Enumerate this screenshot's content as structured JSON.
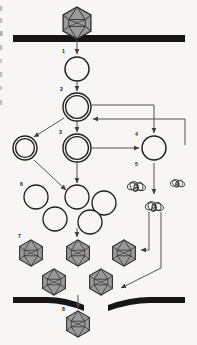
{
  "figure": {
    "background_color": "#f7f6f4",
    "line_color": "#4a4a4a",
    "membrane_color": "#161616",
    "capsid_fill": "#9a9a9a",
    "capsid_stroke": "#2b2b2b",
    "vesicle_stroke": "#1f1f1f",
    "label_color": "#1a1a1a"
  },
  "steps": [
    {
      "id": "1",
      "label": "1",
      "x": 62,
      "y": 53,
      "name": "step-1-entry"
    },
    {
      "id": "2",
      "label": "2",
      "x": 60,
      "y": 91,
      "name": "step-2-uncoating"
    },
    {
      "id": "3",
      "label": "3",
      "x": 59,
      "y": 134,
      "name": "step-3-replication"
    },
    {
      "id": "4",
      "label": "4",
      "x": 135,
      "y": 136,
      "name": "step-4-transcription"
    },
    {
      "id": "5",
      "label": "5",
      "x": 135,
      "y": 166,
      "name": "step-5-translation"
    },
    {
      "id": "6",
      "label": "6",
      "x": 20,
      "y": 186,
      "name": "step-6-assembly-pool"
    },
    {
      "id": "7",
      "label": "7",
      "x": 18,
      "y": 238,
      "name": "step-7-maturation"
    },
    {
      "id": "8",
      "label": "8",
      "x": 62,
      "y": 311,
      "name": "step-8-release"
    }
  ],
  "membranes": [
    {
      "name": "top-membrane",
      "x": 13,
      "y": 35,
      "width": 172,
      "height": 7
    },
    {
      "name": "bottom-membrane-left",
      "x": 13,
      "y": 297,
      "width": 72,
      "height": 7
    },
    {
      "name": "bottom-membrane-right",
      "x": 105,
      "y": 297,
      "width": 80,
      "height": 7
    }
  ],
  "virions": [
    {
      "name": "virion-extracellular-top",
      "cx": 77,
      "cy": 23,
      "r": 17
    },
    {
      "name": "virion-assembled-1",
      "cx": 31,
      "cy": 253,
      "r": 13
    },
    {
      "name": "virion-assembled-2",
      "cx": 78,
      "cy": 253,
      "r": 13
    },
    {
      "name": "virion-assembled-3",
      "cx": 124,
      "cy": 253,
      "r": 13
    },
    {
      "name": "virion-assembled-4",
      "cx": 54,
      "cy": 282,
      "r": 13
    },
    {
      "name": "virion-assembled-5",
      "cx": 101,
      "cy": 282,
      "r": 13
    },
    {
      "name": "virion-released",
      "cx": 78,
      "cy": 324,
      "r": 13
    }
  ],
  "vesicles": [
    {
      "name": "vesicle-endosome",
      "cx": 77,
      "cy": 69,
      "r": 12,
      "double": false
    },
    {
      "name": "vesicle-uncoating",
      "cx": 77,
      "cy": 107,
      "r": 14,
      "double": true
    },
    {
      "name": "vesicle-genome-left",
      "cx": 25,
      "cy": 148,
      "r": 12,
      "double": true
    },
    {
      "name": "vesicle-genome-center",
      "cx": 77,
      "cy": 148,
      "r": 14,
      "double": true
    },
    {
      "name": "vesicle-transcript-right",
      "cx": 154,
      "cy": 148,
      "r": 12,
      "double": false
    },
    {
      "name": "vesicle-pool-1",
      "cx": 36,
      "cy": 197,
      "r": 12,
      "double": false
    },
    {
      "name": "vesicle-pool-2",
      "cx": 77,
      "cy": 197,
      "r": 12,
      "double": false
    },
    {
      "name": "vesicle-pool-3",
      "cx": 104,
      "cy": 203,
      "r": 12,
      "double": false
    },
    {
      "name": "vesicle-pool-4",
      "cx": 55,
      "cy": 219,
      "r": 12,
      "double": false
    },
    {
      "name": "vesicle-pool-5",
      "cx": 90,
      "cy": 222,
      "r": 12,
      "double": false
    }
  ],
  "protein_tangles": [
    {
      "name": "protein-tangle-1",
      "cx": 137,
      "cy": 186,
      "scale": 1.0
    },
    {
      "name": "protein-tangle-2",
      "cx": 178,
      "cy": 183,
      "scale": 0.8
    },
    {
      "name": "protein-tangle-3",
      "cx": 155,
      "cy": 206,
      "scale": 1.0
    }
  ],
  "arrows": [
    {
      "name": "arrow-entry-to-endosome",
      "from": "virion-top",
      "to": "vesicle-endosome"
    },
    {
      "name": "arrow-endosome-to-uncoating",
      "from": "vesicle-endosome",
      "to": "vesicle-uncoating"
    },
    {
      "name": "arrow-uncoating-to-genome-left",
      "from": "vesicle-uncoating",
      "to": "vesicle-genome-left"
    },
    {
      "name": "arrow-uncoating-to-genome-center",
      "from": "vesicle-uncoating",
      "to": "vesicle-genome-center"
    },
    {
      "name": "arrow-uncoating-to-transcript-right",
      "from": "vesicle-uncoating",
      "to": "vesicle-transcript-right"
    },
    {
      "name": "arrow-genome-center-to-transcript",
      "from": "vesicle-genome-center",
      "to": "vesicle-transcript-right"
    },
    {
      "name": "arrow-feedback-to-genome-center",
      "from": "right-loop",
      "to": "vesicle-genome-center"
    },
    {
      "name": "arrow-transcript-to-proteins",
      "from": "vesicle-transcript-right",
      "to": "protein-tangle-3"
    },
    {
      "name": "arrow-genome-left-to-pool",
      "from": "vesicle-genome-left",
      "to": "vesicle-pool-2"
    },
    {
      "name": "arrow-genome-center-to-pool",
      "from": "vesicle-genome-center",
      "to": "vesicle-pool-2"
    },
    {
      "name": "arrow-proteins-to-virion-3",
      "from": "protein-tangles",
      "to": "virion-assembled-3"
    },
    {
      "name": "arrow-proteins-to-membrane",
      "from": "protein-tangles",
      "to": "bottom-membrane-right"
    },
    {
      "name": "arrow-pool-to-virions",
      "from": "vesicle-pool-2",
      "to": "virion-assembled-2"
    },
    {
      "name": "arrow-virions-to-release",
      "from": "virion-assembled-4",
      "to": "virion-released"
    }
  ]
}
